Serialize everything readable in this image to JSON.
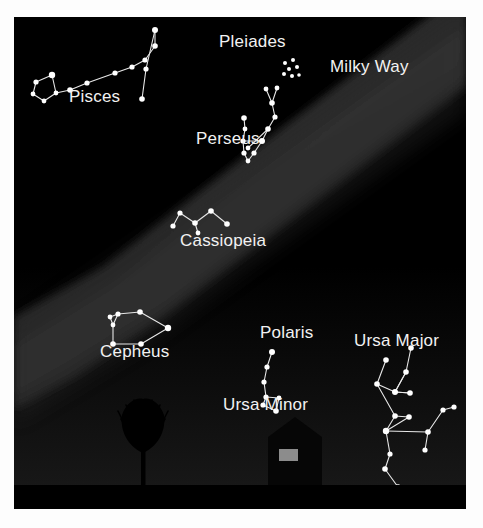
{
  "figure": {
    "kind": "star-chart",
    "title_visible": false,
    "background_color": "#000000",
    "paper_color": "#fdfdfd",
    "star_color": "#ffffff",
    "line_color": "#e8e8e8",
    "label_color": "#f2f2f2"
  },
  "labels": {
    "pisces": "Pisces",
    "pleiades": "Pleiades",
    "milky_way": "Milky Way",
    "perseus": "Perseus",
    "cassiopeia": "Cassiopeia",
    "cepheus": "Cepheus",
    "polaris": "Polaris",
    "ursa_minor": "Ursa Minor",
    "ursa_major": "Ursa Major"
  },
  "chart_data": {
    "type": "scatter",
    "xlabel": "",
    "ylabel": "",
    "xlim": [
      0,
      452
    ],
    "ylim": [
      0,
      492
    ],
    "grid": false,
    "legend": "none",
    "coordinate_note": "x/y are pixel positions inside the 452x492 chart area, y increases downward",
    "annotations": [
      {
        "name": "milky-way-band",
        "text": "Milky Way",
        "x": 316,
        "y": 55,
        "anchor": "start"
      },
      {
        "name": "pleiades-label",
        "text": "Pleiades",
        "x": 205,
        "y": 30,
        "anchor": "start"
      },
      {
        "name": "pisces-label",
        "text": "Pisces",
        "x": 55,
        "y": 85,
        "anchor": "start"
      },
      {
        "name": "perseus-label",
        "text": "Perseus",
        "x": 182,
        "y": 127,
        "anchor": "start"
      },
      {
        "name": "cassiopeia-label",
        "text": "Cassiopeia",
        "x": 166,
        "y": 229,
        "anchor": "start"
      },
      {
        "name": "cepheus-label",
        "text": "Cepheus",
        "x": 86,
        "y": 340,
        "anchor": "start"
      },
      {
        "name": "polaris-label",
        "text": "Polaris",
        "x": 246,
        "y": 321,
        "anchor": "start"
      },
      {
        "name": "ursa-minor-label",
        "text": "Ursa Minor",
        "x": 209,
        "y": 393,
        "anchor": "start"
      },
      {
        "name": "ursa-major-label",
        "text": "Ursa Major",
        "x": 340,
        "y": 329,
        "anchor": "start"
      }
    ],
    "constellations": [
      {
        "name": "Pisces",
        "stars": [
          {
            "x": 22,
            "y": 65,
            "r": 2.6
          },
          {
            "x": 19,
            "y": 77,
            "r": 2.4
          },
          {
            "x": 30,
            "y": 84,
            "r": 2.4
          },
          {
            "x": 42,
            "y": 76,
            "r": 2.4
          },
          {
            "x": 38,
            "y": 58,
            "r": 3.2
          },
          {
            "x": 56,
            "y": 73,
            "r": 2.8
          },
          {
            "x": 73,
            "y": 66,
            "r": 2.6
          },
          {
            "x": 101,
            "y": 56,
            "r": 2.6
          },
          {
            "x": 118,
            "y": 50,
            "r": 2.6
          },
          {
            "x": 131,
            "y": 43,
            "r": 2.6
          },
          {
            "x": 141,
            "y": 29,
            "r": 2.8
          },
          {
            "x": 141,
            "y": 13,
            "r": 3.0
          },
          {
            "x": 132,
            "y": 52,
            "r": 2.6
          },
          {
            "x": 128,
            "y": 82,
            "r": 2.8
          }
        ],
        "edges": [
          [
            0,
            1
          ],
          [
            1,
            2
          ],
          [
            2,
            3
          ],
          [
            3,
            4
          ],
          [
            4,
            0
          ],
          [
            3,
            5
          ],
          [
            5,
            6
          ],
          [
            6,
            7
          ],
          [
            7,
            8
          ],
          [
            8,
            9
          ],
          [
            9,
            10
          ],
          [
            10,
            11
          ],
          [
            11,
            12
          ],
          [
            12,
            13
          ]
        ]
      },
      {
        "name": "Perseus",
        "stars": [
          {
            "x": 252,
            "y": 72,
            "r": 2.4
          },
          {
            "x": 263,
            "y": 71,
            "r": 2.4
          },
          {
            "x": 258,
            "y": 86,
            "r": 2.8
          },
          {
            "x": 261,
            "y": 100,
            "r": 2.6
          },
          {
            "x": 254,
            "y": 112,
            "r": 2.8
          },
          {
            "x": 248,
            "y": 124,
            "r": 3.0
          },
          {
            "x": 240,
            "y": 136,
            "r": 2.6
          },
          {
            "x": 234,
            "y": 144,
            "r": 2.4
          },
          {
            "x": 230,
            "y": 101,
            "r": 2.8
          },
          {
            "x": 231,
            "y": 112,
            "r": 2.4
          },
          {
            "x": 229,
            "y": 124,
            "r": 2.6
          },
          {
            "x": 230,
            "y": 136,
            "r": 2.6
          },
          {
            "x": 234,
            "y": 131,
            "r": 2.4
          }
        ],
        "edges": [
          [
            0,
            2
          ],
          [
            1,
            2
          ],
          [
            2,
            3
          ],
          [
            3,
            4
          ],
          [
            4,
            5
          ],
          [
            5,
            6
          ],
          [
            6,
            7
          ],
          [
            8,
            9
          ],
          [
            9,
            10
          ],
          [
            10,
            11
          ],
          [
            5,
            10
          ],
          [
            11,
            7
          ],
          [
            4,
            12
          ]
        ]
      },
      {
        "name": "Cassiopeia",
        "stars": [
          {
            "x": 159,
            "y": 209,
            "r": 2.6
          },
          {
            "x": 166,
            "y": 196,
            "r": 2.6
          },
          {
            "x": 181,
            "y": 206,
            "r": 2.8
          },
          {
            "x": 184,
            "y": 216,
            "r": 2.4
          },
          {
            "x": 197,
            "y": 194,
            "r": 2.8
          },
          {
            "x": 213,
            "y": 207,
            "r": 2.8
          }
        ],
        "edges": [
          [
            0,
            1
          ],
          [
            1,
            2
          ],
          [
            2,
            4
          ],
          [
            4,
            5
          ],
          [
            2,
            3
          ]
        ]
      },
      {
        "name": "Cepheus",
        "stars": [
          {
            "x": 96,
            "y": 300,
            "r": 2.4
          },
          {
            "x": 104,
            "y": 297,
            "r": 2.6
          },
          {
            "x": 99,
            "y": 308,
            "r": 2.4
          },
          {
            "x": 126,
            "y": 295,
            "r": 2.8
          },
          {
            "x": 154,
            "y": 311,
            "r": 3.2
          },
          {
            "x": 127,
            "y": 327,
            "r": 2.8
          },
          {
            "x": 99,
            "y": 327,
            "r": 2.8
          }
        ],
        "edges": [
          [
            1,
            3
          ],
          [
            3,
            4
          ],
          [
            4,
            5
          ],
          [
            5,
            6
          ],
          [
            6,
            2
          ],
          [
            2,
            1
          ],
          [
            0,
            1
          ],
          [
            0,
            2
          ]
        ]
      },
      {
        "name": "Ursa Minor",
        "stars": [
          {
            "x": 258,
            "y": 335,
            "r": 3.0
          },
          {
            "x": 253,
            "y": 350,
            "r": 2.6
          },
          {
            "x": 250,
            "y": 365,
            "r": 2.6
          },
          {
            "x": 252,
            "y": 380,
            "r": 2.6
          },
          {
            "x": 249,
            "y": 388,
            "r": 2.6
          },
          {
            "x": 262,
            "y": 394,
            "r": 2.8
          },
          {
            "x": 265,
            "y": 381,
            "r": 2.4
          }
        ],
        "edges": [
          [
            0,
            1
          ],
          [
            1,
            2
          ],
          [
            2,
            3
          ],
          [
            3,
            4
          ],
          [
            4,
            5
          ],
          [
            5,
            6
          ],
          [
            6,
            3
          ]
        ]
      },
      {
        "name": "Ursa Major",
        "stars": [
          {
            "x": 372,
            "y": 343,
            "r": 2.8
          },
          {
            "x": 363,
            "y": 367,
            "r": 2.8
          },
          {
            "x": 381,
            "y": 375,
            "r": 3.0
          },
          {
            "x": 392,
            "y": 355,
            "r": 2.8
          },
          {
            "x": 397,
            "y": 331,
            "r": 2.8
          },
          {
            "x": 381,
            "y": 399,
            "r": 2.8
          },
          {
            "x": 395,
            "y": 400,
            "r": 2.8
          },
          {
            "x": 396,
            "y": 376,
            "r": 2.8
          },
          {
            "x": 372,
            "y": 414,
            "r": 3.2
          },
          {
            "x": 414,
            "y": 415,
            "r": 2.8
          },
          {
            "x": 429,
            "y": 393,
            "r": 2.6
          },
          {
            "x": 440,
            "y": 390,
            "r": 2.6
          },
          {
            "x": 411,
            "y": 433,
            "r": 2.6
          },
          {
            "x": 376,
            "y": 437,
            "r": 2.6
          },
          {
            "x": 371,
            "y": 452,
            "r": 2.8
          },
          {
            "x": 384,
            "y": 470,
            "r": 2.8
          }
        ],
        "edges": [
          [
            0,
            1
          ],
          [
            1,
            2
          ],
          [
            2,
            3
          ],
          [
            3,
            4
          ],
          [
            2,
            7
          ],
          [
            1,
            5
          ],
          [
            5,
            6
          ],
          [
            6,
            8
          ],
          [
            5,
            8
          ],
          [
            8,
            9
          ],
          [
            9,
            10
          ],
          [
            10,
            11
          ],
          [
            9,
            12
          ],
          [
            8,
            13
          ],
          [
            13,
            14
          ],
          [
            14,
            15
          ],
          [
            7,
            2
          ],
          [
            3,
            2
          ]
        ]
      }
    ],
    "clusters": [
      {
        "name": "Pleiades",
        "stars": [
          {
            "x": 271,
            "y": 46,
            "r": 2.0
          },
          {
            "x": 279,
            "y": 43,
            "r": 2.0
          },
          {
            "x": 275,
            "y": 52,
            "r": 2.0
          },
          {
            "x": 283,
            "y": 50,
            "r": 2.0
          },
          {
            "x": 270,
            "y": 57,
            "r": 2.0
          },
          {
            "x": 278,
            "y": 59,
            "r": 2.0
          },
          {
            "x": 285,
            "y": 58,
            "r": 1.8
          }
        ]
      }
    ],
    "features": [
      {
        "name": "milky-way-band",
        "type": "band",
        "fill": "#2b2b2b",
        "orientation": "diagonal NE-SW"
      },
      {
        "name": "horizon-glow",
        "type": "gradient-region",
        "fill": "#151515"
      },
      {
        "name": "ground",
        "type": "silhouette",
        "fill": "#000000",
        "top_y": 468
      },
      {
        "name": "tree",
        "type": "silhouette",
        "fill": "#000000"
      },
      {
        "name": "house",
        "type": "silhouette",
        "fill": "#050505"
      },
      {
        "name": "house-window",
        "type": "lit-window",
        "fill": "#8c8c8c"
      }
    ]
  }
}
